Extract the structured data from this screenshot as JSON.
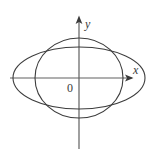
{
  "figure": {
    "title": "",
    "background_color": "#ffffff",
    "width": 147,
    "height": 155,
    "axis_color": "#555555",
    "curve_color": "#3d3d3d",
    "origin_label": "0",
    "x_axis_label": "x",
    "y_axis_label": "y"
  },
  "chart_data": {
    "type": "line",
    "title": "",
    "xlabel": "x",
    "ylabel": "y",
    "grid": false,
    "legend": null,
    "annotations": [
      {
        "text": "0",
        "x": 0,
        "y": 0,
        "role": "origin-label"
      },
      {
        "text": "x",
        "x": 56,
        "y": 0,
        "role": "x-axis-tip-label"
      },
      {
        "text": "y",
        "x": 0,
        "y": 62,
        "role": "y-axis-tip-label"
      }
    ],
    "axes": {
      "origin_px": {
        "x": 79,
        "y": 78
      },
      "x_axis_px": {
        "x1": 10,
        "y1": 78,
        "x2": 134,
        "y2": 78,
        "arrow": "right"
      },
      "y_axis_px": {
        "x1": 79,
        "y1": 16,
        "x2": 79,
        "y2": 149,
        "arrow": "up"
      },
      "xlim": [
        -70,
        56
      ],
      "ylim": [
        -71,
        62
      ]
    },
    "series": [
      {
        "name": "wide ellipse",
        "shape": "ellipse",
        "center": [
          0,
          0
        ],
        "semi_axis_x": 66,
        "semi_axis_y": 31,
        "center_px": [
          79,
          78
        ],
        "rx_px": 66,
        "ry_px": 31,
        "color": "#3d3d3d"
      },
      {
        "name": "tall ellipse",
        "shape": "ellipse",
        "center": [
          0,
          0
        ],
        "semi_axis_x": 44,
        "semi_axis_y": 40,
        "center_px": [
          79,
          78
        ],
        "rx_px": 44,
        "ry_px": 40,
        "color": "#3d3d3d"
      }
    ]
  }
}
